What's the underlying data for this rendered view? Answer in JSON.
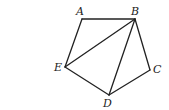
{
  "diagram": {
    "type": "pentagon-with-diagonals",
    "points": {
      "A": {
        "x": 82,
        "y": 19,
        "label": "A",
        "lx": 76,
        "ly": 6
      },
      "B": {
        "x": 135,
        "y": 19,
        "label": "B",
        "lx": 131,
        "ly": 6
      },
      "C": {
        "x": 150,
        "y": 70,
        "label": "C",
        "lx": 153,
        "ly": 64
      },
      "D": {
        "x": 109,
        "y": 95,
        "label": "D",
        "lx": 103,
        "ly": 98
      },
      "E": {
        "x": 65,
        "y": 67,
        "label": "E",
        "lx": 54,
        "ly": 62
      }
    },
    "segments": [
      [
        "A",
        "B"
      ],
      [
        "B",
        "C"
      ],
      [
        "C",
        "D"
      ],
      [
        "D",
        "E"
      ],
      [
        "E",
        "A"
      ],
      [
        "B",
        "E"
      ],
      [
        "B",
        "D"
      ]
    ]
  }
}
